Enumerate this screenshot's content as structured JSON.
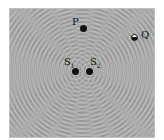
{
  "diagram": {
    "points": {
      "P": {
        "label": "P"
      },
      "Q": {
        "label": "Q"
      },
      "S1": {
        "label": "S",
        "sub": "1"
      },
      "S2": {
        "label": "S",
        "sub": "2"
      }
    },
    "colors": {
      "background": "#9a9a9a",
      "crest": "#c8c8c8",
      "trough": "#6e6e6e",
      "dot": "#111111"
    }
  }
}
